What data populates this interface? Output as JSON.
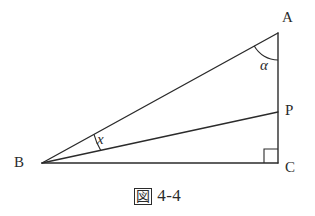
{
  "figure": {
    "caption_kanji": "図",
    "caption_number": "4-4",
    "caption_full": "図 4-4",
    "background_color": "#ffffff",
    "stroke_color": "#2b2b2b",
    "width": 315,
    "height": 216
  },
  "diagram": {
    "type": "right-triangle-with-interior-cevian",
    "points": {
      "A": {
        "label": "A",
        "x": 278,
        "y": 33
      },
      "B": {
        "label": "B",
        "x": 42,
        "y": 163
      },
      "C": {
        "label": "C",
        "x": 278,
        "y": 163
      },
      "P": {
        "label": "P",
        "x": 278,
        "y": 112
      }
    },
    "segments": [
      {
        "name": "BA",
        "from": "B",
        "to": "A"
      },
      {
        "name": "BP",
        "from": "B",
        "to": "P"
      },
      {
        "name": "BC",
        "from": "B",
        "to": "C"
      },
      {
        "name": "AC",
        "from": "A",
        "to": "C"
      }
    ],
    "angles": [
      {
        "name": "alpha",
        "label": "α",
        "at": "A",
        "between": [
          "AB",
          "AC"
        ]
      },
      {
        "name": "x",
        "label": "x",
        "at": "B",
        "between": [
          "BA",
          "BP"
        ]
      },
      {
        "name": "right-angle",
        "label": "",
        "at": "C",
        "between": [
          "CA",
          "CB"
        ],
        "marker": "square"
      }
    ]
  },
  "labels": {
    "A": "A",
    "B": "B",
    "C": "C",
    "P": "P",
    "alpha": "α",
    "x": "x"
  }
}
